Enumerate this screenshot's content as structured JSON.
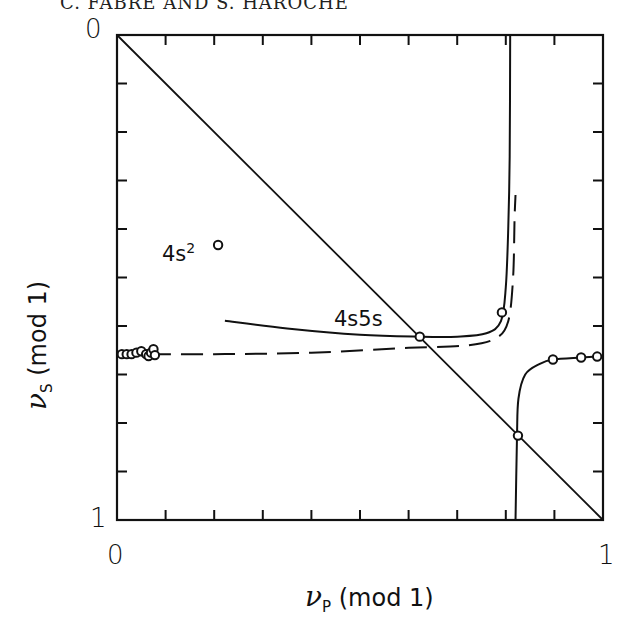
{
  "page_header": "C. FABRE AND S. HAROCHE",
  "chart_data": {
    "type": "line",
    "title": "",
    "xlabel": "ν_P (mod 1)",
    "ylabel": "ν_S (mod 1)",
    "xlim": [
      0,
      1
    ],
    "ylim": [
      1,
      0
    ],
    "x_tick_labels": [
      "0",
      "1"
    ],
    "y_tick_labels": [
      "0",
      "1"
    ],
    "x_ticks_minor_count": 10,
    "y_ticks_minor_count": 10,
    "grid": false,
    "legend": null,
    "annotations": [
      {
        "text": "4s²",
        "x": 0.12,
        "y": 0.4
      },
      {
        "text": "4s5s",
        "x": 0.45,
        "y": 0.57
      }
    ],
    "series": [
      {
        "name": "diagonal",
        "style": "solid",
        "points": [
          [
            0,
            0
          ],
          [
            1,
            1
          ]
        ]
      },
      {
        "name": "4s5s-theory-upper",
        "style": "solid",
        "points": [
          [
            0.222,
            0.589
          ],
          [
            0.35,
            0.605
          ],
          [
            0.5,
            0.618
          ],
          [
            0.623,
            0.622
          ],
          [
            0.7,
            0.622
          ],
          [
            0.76,
            0.615
          ],
          [
            0.79,
            0.59
          ],
          [
            0.8,
            0.52
          ],
          [
            0.805,
            0.4
          ],
          [
            0.808,
            0.25
          ],
          [
            0.809,
            0.0
          ]
        ]
      },
      {
        "name": "dashed-mqdt",
        "style": "dashed",
        "points": [
          [
            0.0,
            0.658
          ],
          [
            0.2,
            0.658
          ],
          [
            0.4,
            0.655
          ],
          [
            0.6,
            0.645
          ],
          [
            0.72,
            0.64
          ],
          [
            0.78,
            0.625
          ],
          [
            0.805,
            0.59
          ],
          [
            0.815,
            0.5
          ],
          [
            0.818,
            0.38
          ],
          [
            0.82,
            0.33
          ]
        ]
      },
      {
        "name": "lower-branch",
        "style": "solid",
        "points": [
          [
            0.82,
            1.0
          ],
          [
            0.823,
            0.83
          ],
          [
            0.826,
            0.75
          ],
          [
            0.84,
            0.7
          ],
          [
            0.87,
            0.678
          ],
          [
            0.897,
            0.669
          ],
          [
            0.955,
            0.665
          ],
          [
            0.988,
            0.663
          ]
        ]
      },
      {
        "name": "experimental-points",
        "style": "markers",
        "points": [
          [
            0.208,
            0.433
          ],
          [
            0.623,
            0.622
          ],
          [
            0.792,
            0.572
          ],
          [
            0.825,
            0.826
          ],
          [
            0.897,
            0.669
          ],
          [
            0.955,
            0.665
          ],
          [
            0.988,
            0.663
          ],
          [
            0.01,
            0.658
          ],
          [
            0.02,
            0.658
          ],
          [
            0.03,
            0.658
          ],
          [
            0.04,
            0.655
          ],
          [
            0.05,
            0.652
          ],
          [
            0.06,
            0.658
          ],
          [
            0.065,
            0.662
          ],
          [
            0.07,
            0.655
          ],
          [
            0.075,
            0.648
          ],
          [
            0.078,
            0.66
          ]
        ]
      }
    ]
  },
  "labels": {
    "x_origin": "0",
    "x_end": "1",
    "y_origin": "0",
    "y_end": "1",
    "x_axis_nu": "ν",
    "x_axis_sub": "P",
    "x_axis_mod": "(mod 1)",
    "y_axis_nu": "ν",
    "y_axis_sub": "S",
    "y_axis_mod": "(mod 1)",
    "annot_4s2_base": "4s",
    "annot_4s2_sup": "2",
    "annot_4s5s": "4s5s"
  }
}
